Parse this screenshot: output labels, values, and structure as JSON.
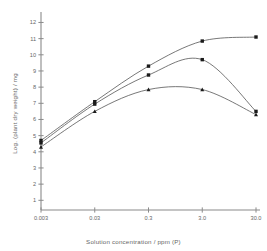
{
  "chart_data": {
    "type": "line",
    "title": "",
    "xlabel": "Solution concentration / ppm (P)",
    "ylabel": "Log. (plant dry weight) / mg",
    "x_scale": "log",
    "x_tick_labels": [
      "0.003",
      "0.03",
      "0.3",
      "3.0",
      "30.0"
    ],
    "x_tick_values": [
      0.003,
      0.03,
      0.3,
      3.0,
      30.0
    ],
    "y_tick_labels": [
      "1",
      "2",
      "3",
      "4",
      "5",
      "6",
      "7",
      "8",
      "9",
      "10",
      "11",
      "12"
    ],
    "y_tick_values": [
      1,
      2,
      3,
      4,
      5,
      6,
      7,
      8,
      9,
      10,
      11,
      12
    ],
    "ylim": [
      0.4,
      12.4
    ],
    "grid": false,
    "legend": "none",
    "marker": "filled-square",
    "line_color": "#555555",
    "marker_color": "#1a1a1a",
    "series": [
      {
        "name": "series-1",
        "marker": "filled-square",
        "x": [
          0.003,
          0.03,
          0.3,
          3.0,
          30.0
        ],
        "values": [
          4.7,
          7.1,
          9.3,
          10.85,
          11.1
        ]
      },
      {
        "name": "series-2",
        "marker": "filled-square",
        "x": [
          0.003,
          0.03,
          0.3,
          3.0,
          30.0
        ],
        "values": [
          4.55,
          6.95,
          8.75,
          9.7,
          6.5
        ]
      },
      {
        "name": "series-3",
        "marker": "filled-triangle",
        "x": [
          0.003,
          0.03,
          0.3,
          3.0,
          30.0
        ],
        "values": [
          4.3,
          6.5,
          7.85,
          7.85,
          6.3
        ]
      }
    ]
  }
}
